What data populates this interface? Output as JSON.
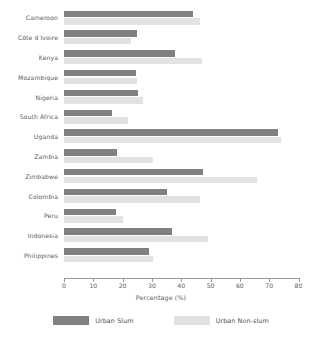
{
  "chart_data": {
    "type": "bar",
    "orientation": "horizontal",
    "title": "",
    "xlabel": "Percentage (%)",
    "ylabel": "",
    "xlim": [
      0,
      80
    ],
    "xticks": [
      0,
      10,
      20,
      30,
      40,
      50,
      60,
      70,
      80
    ],
    "grid": false,
    "legend_position": "bottom",
    "categories": [
      "Cameroon",
      "Côte d Ivoire",
      "Kenya",
      "Mozambique",
      "Nigeria",
      "South Africa",
      "Uganda",
      "Zambia",
      "Zimbabwe",
      "Colombia",
      "Peru",
      "Indonesia",
      "Philippines"
    ],
    "series": [
      {
        "name": "Urban Slum",
        "color": "#808080",
        "values": [
          44,
          25,
          38,
          24.6,
          25.4,
          16.4,
          73,
          18,
          47.5,
          35,
          17.8,
          37,
          29
        ]
      },
      {
        "name": "Urban Non-slum",
        "color": "#e2e2e2",
        "values": [
          46.5,
          23,
          47,
          25,
          27,
          22,
          74,
          30.4,
          66,
          46.5,
          20,
          49,
          30.5
        ]
      }
    ]
  },
  "axis": {
    "tick_labels": [
      "0",
      "10",
      "20",
      "30",
      "40",
      "50",
      "60",
      "70",
      "80"
    ],
    "title": "Percentage (%)"
  },
  "legend": {
    "items": [
      {
        "label": "Urban Slum",
        "color": "#808080"
      },
      {
        "label": "Urban Non-slum",
        "color": "#e2e2e2"
      }
    ]
  }
}
